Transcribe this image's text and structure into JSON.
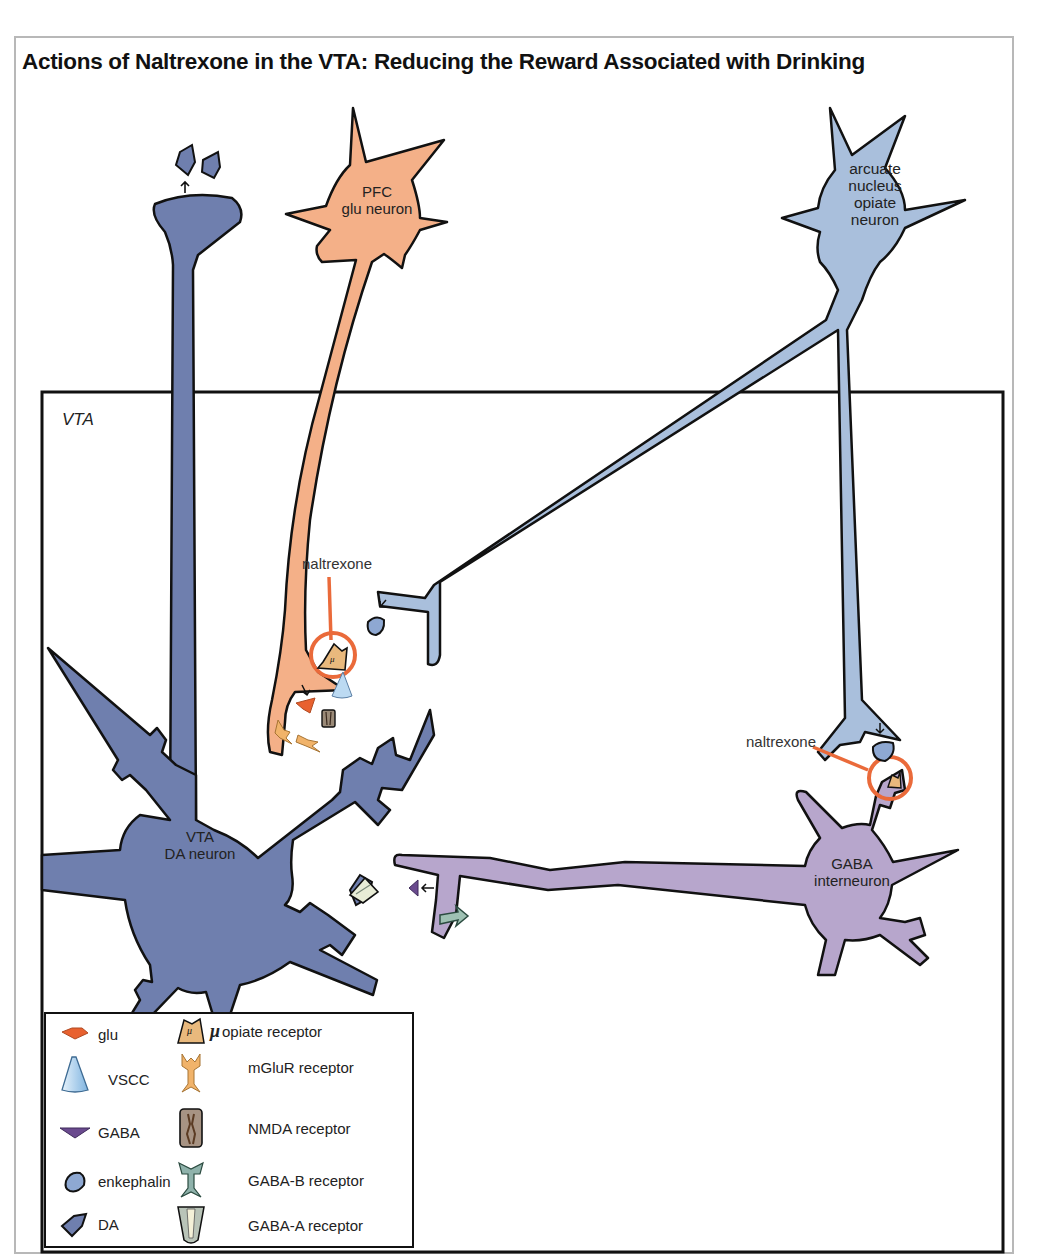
{
  "title": "Actions of Naltrexone in the VTA: Reducing the Reward Associated with Drinking",
  "region_label": "VTA",
  "neurons": {
    "pfc": {
      "line1": "PFC",
      "line2": "glu neuron",
      "color": "#f4b088"
    },
    "arcuate": {
      "line1": "arcuate",
      "line2": "nucleus",
      "line3": "opiate",
      "line4": "neuron",
      "color": "#a9bfdc"
    },
    "vta_da": {
      "line1": "VTA",
      "line2": "DA neuron",
      "color": "#6f7fae"
    },
    "gaba": {
      "line1": "GABA",
      "line2": "interneuron",
      "color": "#b7a6cc"
    }
  },
  "annotations": {
    "naltrexone_1": "naltrexone",
    "naltrexone_2": "naltrexone",
    "naltrexone_color": "#ea6a3a"
  },
  "legend": {
    "items": [
      {
        "icon": "glu-icon",
        "label": "glu"
      },
      {
        "icon": "vscc-icon",
        "label": "VSCC"
      },
      {
        "icon": "gaba-icon",
        "label": "GABA"
      },
      {
        "icon": "enkephalin-icon",
        "label": "enkephalin"
      },
      {
        "icon": "da-icon",
        "label": "DA"
      },
      {
        "icon": "opiate-receptor-icon",
        "symbol": "μ",
        "label": "opiate receptor"
      },
      {
        "icon": "mglur-receptor-icon",
        "label": "mGluR receptor"
      },
      {
        "icon": "nmda-receptor-icon",
        "label": "NMDA receptor"
      },
      {
        "icon": "gaba-b-receptor-icon",
        "label": "GABA-B receptor"
      },
      {
        "icon": "gaba-a-receptor-icon",
        "label": "GABA-A receptor"
      }
    ]
  }
}
